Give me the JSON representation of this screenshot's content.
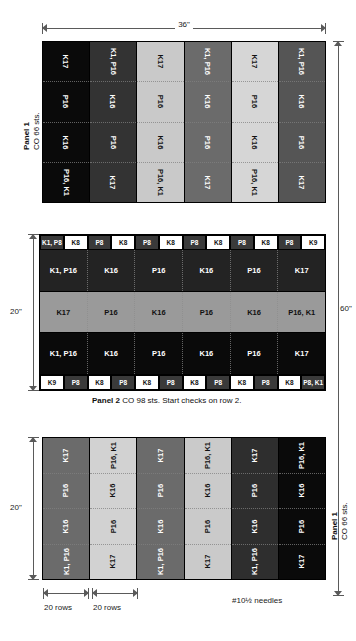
{
  "document": {
    "title": "Knitting panel schematic"
  },
  "dimensions": {
    "top_width": "36\"",
    "overall_height": "60\"",
    "panel2_height": "20\"",
    "panel3_height": "20\"",
    "rows_left": "20 rows",
    "rows_right": "20 rows"
  },
  "notes": {
    "needles": "#10½ needles"
  },
  "colors": {
    "black": "#0a0a0a",
    "dark_gray": "#2f2f2f",
    "mid_dark_gray": "#4a4a4a",
    "mid_gray": "#6e6e6e",
    "light_gray": "#b8b8b8",
    "lighter_gray": "#cfcfcf",
    "white": "#ffffff",
    "rule": "#5a5a5a"
  },
  "panel1": {
    "label_line1": "Panel 1",
    "label_line2": "CO 66 sts.",
    "columns": [
      {
        "fill": "#0a0a0a",
        "text": "#ffffff",
        "cells": [
          "K17",
          "P16",
          "K16",
          "P16, K1"
        ]
      },
      {
        "fill": "#333333",
        "text": "#ffffff",
        "cells": [
          "K1, P16",
          "K16",
          "P16",
          "K17"
        ]
      },
      {
        "fill": "#c9c9c9",
        "text": "#111111",
        "cells": [
          "K17",
          "P16",
          "K16",
          "P16, K1"
        ]
      },
      {
        "fill": "#6b6b6b",
        "text": "#ffffff",
        "cells": [
          "K1, P16",
          "K16",
          "P16",
          "K17"
        ]
      },
      {
        "fill": "#d6d6d6",
        "text": "#111111",
        "cells": [
          "K17",
          "P16",
          "K16",
          "P16, K1"
        ]
      },
      {
        "fill": "#555555",
        "text": "#ffffff",
        "cells": [
          "K1, P16",
          "K16",
          "P16",
          "K17"
        ]
      }
    ]
  },
  "panel2": {
    "caption_bold": "Panel 2",
    "caption_rest": " CO 98 sts. Start checks on row 2.",
    "top_checks": [
      {
        "text": "K1, P8",
        "fill": "#3a3a3a",
        "fg": "#ffffff"
      },
      {
        "text": "K8",
        "fill": "#ffffff",
        "fg": "#111111"
      },
      {
        "text": "P8",
        "fill": "#3a3a3a",
        "fg": "#ffffff"
      },
      {
        "text": "K8",
        "fill": "#ffffff",
        "fg": "#111111"
      },
      {
        "text": "P8",
        "fill": "#3a3a3a",
        "fg": "#ffffff"
      },
      {
        "text": "K8",
        "fill": "#ffffff",
        "fg": "#111111"
      },
      {
        "text": "P8",
        "fill": "#3a3a3a",
        "fg": "#ffffff"
      },
      {
        "text": "K8",
        "fill": "#ffffff",
        "fg": "#111111"
      },
      {
        "text": "P8",
        "fill": "#3a3a3a",
        "fg": "#ffffff"
      },
      {
        "text": "K8",
        "fill": "#ffffff",
        "fg": "#111111"
      },
      {
        "text": "P8",
        "fill": "#3a3a3a",
        "fg": "#ffffff"
      },
      {
        "text": "K9",
        "fill": "#ffffff",
        "fg": "#111111"
      }
    ],
    "bands": [
      {
        "fill": "#232323",
        "text": "#ffffff",
        "cells": [
          "K1, P16",
          "K16",
          "P16",
          "K16",
          "P16",
          "K17"
        ]
      },
      {
        "fill": "#9a9a9a",
        "text": "#111111",
        "cells": [
          "K17",
          "P16",
          "K16",
          "P16",
          "K16",
          "P16, K1"
        ]
      },
      {
        "fill": "#0a0a0a",
        "text": "#ffffff",
        "cells": [
          "K1, P16",
          "K16",
          "P16",
          "K16",
          "P16",
          "K17"
        ]
      }
    ],
    "bottom_checks": [
      {
        "text": "K9",
        "fill": "#ffffff",
        "fg": "#111111"
      },
      {
        "text": "P8",
        "fill": "#3a3a3a",
        "fg": "#ffffff"
      },
      {
        "text": "K8",
        "fill": "#ffffff",
        "fg": "#111111"
      },
      {
        "text": "P8",
        "fill": "#3a3a3a",
        "fg": "#ffffff"
      },
      {
        "text": "K8",
        "fill": "#ffffff",
        "fg": "#111111"
      },
      {
        "text": "P8",
        "fill": "#3a3a3a",
        "fg": "#ffffff"
      },
      {
        "text": "K8",
        "fill": "#ffffff",
        "fg": "#111111"
      },
      {
        "text": "P8",
        "fill": "#3a3a3a",
        "fg": "#ffffff"
      },
      {
        "text": "K8",
        "fill": "#ffffff",
        "fg": "#111111"
      },
      {
        "text": "P8",
        "fill": "#3a3a3a",
        "fg": "#ffffff"
      },
      {
        "text": "K8",
        "fill": "#ffffff",
        "fg": "#111111"
      },
      {
        "text": "P8, K1",
        "fill": "#3a3a3a",
        "fg": "#ffffff"
      }
    ]
  },
  "panel3": {
    "label_line1": "Panel 1",
    "label_line2": "CO 66 sts.",
    "columns": [
      {
        "fill": "#6b6b6b",
        "text": "#ffffff",
        "cells": [
          "K17",
          "P16",
          "K16",
          "K1, P16"
        ]
      },
      {
        "fill": "#d2d2d2",
        "text": "#111111",
        "cells": [
          "P16, K1",
          "K16",
          "P16",
          "K17"
        ]
      },
      {
        "fill": "#6b6b6b",
        "text": "#ffffff",
        "cells": [
          "K17",
          "P16",
          "K16",
          "K1, P16"
        ]
      },
      {
        "fill": "#cacaca",
        "text": "#111111",
        "cells": [
          "P16, K1",
          "K16",
          "P16",
          "K17"
        ]
      },
      {
        "fill": "#2e2e2e",
        "text": "#ffffff",
        "cells": [
          "K17",
          "P16",
          "K16",
          "K1, P16"
        ]
      },
      {
        "fill": "#0a0a0a",
        "text": "#ffffff",
        "cells": [
          "P16, K1",
          "K16",
          "P16",
          "K17"
        ]
      }
    ]
  }
}
